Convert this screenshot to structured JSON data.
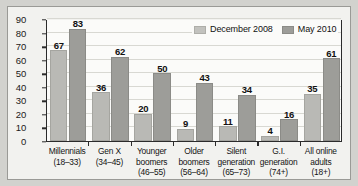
{
  "chart_data": {
    "type": "bar",
    "title": "",
    "subtitle": "",
    "xlabel": "",
    "ylabel": "",
    "ylim": [
      0,
      90
    ],
    "ytick_step": 10,
    "yticks": [
      "0",
      "10",
      "20",
      "30",
      "40",
      "50",
      "60",
      "70",
      "80",
      "90"
    ],
    "grid": true,
    "legend_position": "top-right",
    "categories": [
      "Millennials (18–33)",
      "Gen X (34–45)",
      "Younger boomers (46–55)",
      "Older boomers (56–64)",
      "Silent generation (65–73)",
      "G.I. generation (74+)",
      "All online adults (18+)"
    ],
    "category_lines": [
      [
        "Millennials",
        "(18–33)"
      ],
      [
        "Gen X",
        "(34–45)"
      ],
      [
        "Younger",
        "boomers",
        "(46–55)"
      ],
      [
        "Older",
        "boomers",
        "(56–64)"
      ],
      [
        "Silent",
        "generation",
        "(65–73)"
      ],
      [
        "G.I.",
        "generation",
        "(74+)"
      ],
      [
        "All online",
        "adults",
        "(18+)"
      ]
    ],
    "series": [
      {
        "name": "December 2008",
        "color": "#b9b9b5",
        "values": [
          67,
          36,
          20,
          9,
          11,
          4,
          35
        ]
      },
      {
        "name": "May 2010",
        "color": "#9d9d99",
        "values": [
          83,
          62,
          50,
          43,
          34,
          16,
          61
        ]
      }
    ]
  },
  "legend": {
    "items": [
      {
        "label": "December 2008"
      },
      {
        "label": "May 2010"
      }
    ]
  }
}
